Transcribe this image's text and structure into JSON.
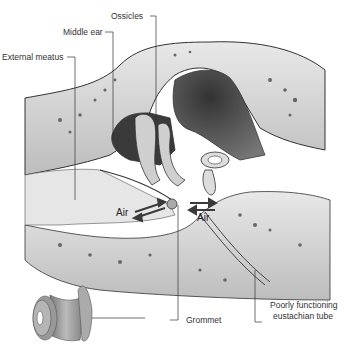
{
  "diagram": {
    "type": "anatomical-illustration",
    "labels": {
      "ossicles": "Ossicles",
      "middle_ear": "Middle ear",
      "external_meatus": "External meatus",
      "grommet": "Grommet",
      "eustachian_line1": "Poorly functioning",
      "eustachian_line2": "eustachian tube"
    },
    "air_labels": {
      "left": "Air",
      "right": "Air"
    },
    "colors": {
      "bone": "#d9d9d9",
      "cavity_dark": "#4a4a4a",
      "outline": "#333333",
      "arrow": "#3a3a3a",
      "grommet": "#9a9a9a"
    }
  }
}
